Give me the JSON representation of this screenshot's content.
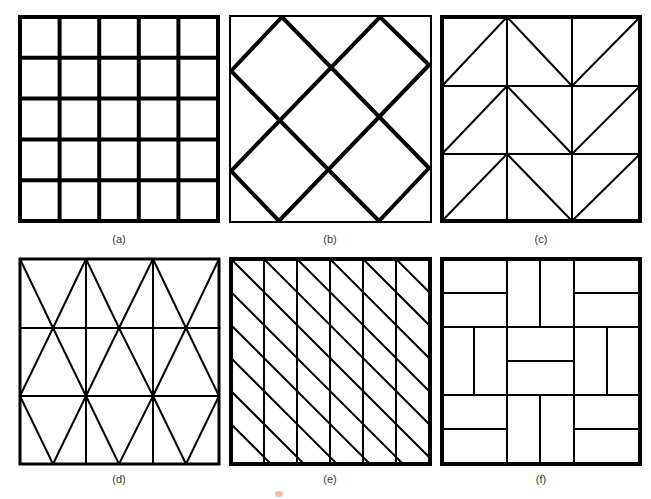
{
  "figure": {
    "panels": [
      {
        "id": "a",
        "caption": "(a)",
        "pattern": "square-grid-5x5",
        "description": "5×5 square grid, all heavy lines"
      },
      {
        "id": "b",
        "caption": "(b)",
        "pattern": "diagonal-diamond-lattice",
        "description": "Thin outer square with heavy 45° diagonal lines forming diamonds"
      },
      {
        "id": "c",
        "caption": "(c)",
        "pattern": "3x3-grid-with-chevron-diagonals",
        "description": "3×3 grid, each cell split by a diagonal forming chevron/zig-zag rows"
      },
      {
        "id": "d",
        "caption": "(d)",
        "pattern": "3x3-grid-with-triangles",
        "description": "3×3 grid with crossing diagonals forming tall triangles"
      },
      {
        "id": "e",
        "caption": "(e)",
        "pattern": "6-column-parallel-diagonals",
        "description": "6 vertical strips cut by parallel descending diagonals"
      },
      {
        "id": "f",
        "caption": "(f)",
        "pattern": "basketweave-parquet",
        "description": "Basketweave parquet of rectangle pairs on a 3×3 block grid"
      }
    ],
    "line_color": "#000000",
    "background_color": "#ffffff"
  }
}
